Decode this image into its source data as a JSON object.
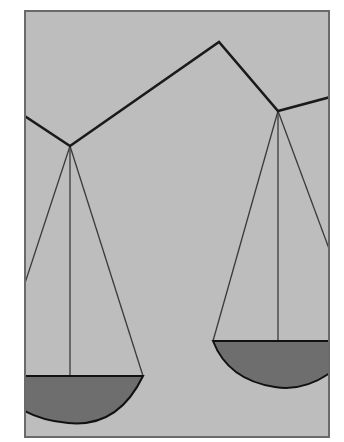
{
  "illustration": {
    "subject": "balance-scale",
    "colors": {
      "page_background": "#ffffff",
      "frame_fill": "#bdbdbd",
      "frame_border": "#6a6a6a",
      "beam": "#1a1a1a",
      "strings": "#3a3a3a",
      "pan_fill": "#6e6e6e",
      "pan_outline": "#111111"
    },
    "frame": {
      "x": 25,
      "y": 11,
      "width": 304,
      "height": 426
    },
    "beam_points": "25,116 70,146 219,42 278,111 329,97",
    "left_pan": {
      "pivot": "70,146",
      "string_left": "25,283",
      "string_center": "70,376",
      "string_right": "143,376",
      "bowl_path": "M 25 376 L 143 376 Q 120 430 70 422 Q 40 420 25 412 Z"
    },
    "right_pan": {
      "pivot": "278,111",
      "string_left": "213,341",
      "string_center": "278,341",
      "string_right": "329,250",
      "bowl_path": "M 213 341 L 329 341 L 329 372 Q 300 392 275 386 Q 230 382 213 341 Z"
    }
  }
}
